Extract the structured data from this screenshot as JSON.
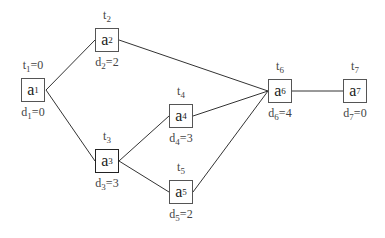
{
  "nodes": [
    {
      "id": "a1",
      "name": "a",
      "sub": "1",
      "t": "t",
      "tsub": "1",
      "tval": "=0",
      "d": "d",
      "dsub": "1",
      "dval": "=0",
      "x": 21,
      "y": 78
    },
    {
      "id": "a2",
      "name": "a",
      "sub": "2",
      "t": "t",
      "tsub": "2",
      "tval": "",
      "d": "d",
      "dsub": "2",
      "dval": "=2",
      "x": 95,
      "y": 28
    },
    {
      "id": "a3",
      "name": "a",
      "sub": "3",
      "t": "t",
      "tsub": "3",
      "tval": "",
      "d": "d",
      "dsub": "3",
      "dval": "=3",
      "x": 95,
      "y": 149
    },
    {
      "id": "a4",
      "name": "a",
      "sub": "4",
      "t": "t",
      "tsub": "4",
      "tval": "",
      "d": "d",
      "dsub": "4",
      "dval": "=3",
      "x": 169,
      "y": 104
    },
    {
      "id": "a5",
      "name": "a",
      "sub": "5",
      "t": "t",
      "tsub": "5",
      "tval": "",
      "d": "d",
      "dsub": "5",
      "dval": "=2",
      "x": 169,
      "y": 180
    },
    {
      "id": "a6",
      "name": "a",
      "sub": "6",
      "t": "t",
      "tsub": "6",
      "tval": "",
      "d": "d",
      "dsub": "6",
      "dval": "=4",
      "x": 268,
      "y": 79
    },
    {
      "id": "a7",
      "name": "a",
      "sub": "7",
      "t": "t",
      "tsub": "7",
      "tval": "",
      "d": "d",
      "dsub": "7",
      "dval": "=0",
      "x": 343,
      "y": 79
    }
  ],
  "edges": [
    [
      "a1",
      "a2"
    ],
    [
      "a1",
      "a3"
    ],
    [
      "a2",
      "a6"
    ],
    [
      "a3",
      "a4"
    ],
    [
      "a3",
      "a5"
    ],
    [
      "a4",
      "a6"
    ],
    [
      "a5",
      "a6"
    ],
    [
      "a6",
      "a7"
    ]
  ]
}
